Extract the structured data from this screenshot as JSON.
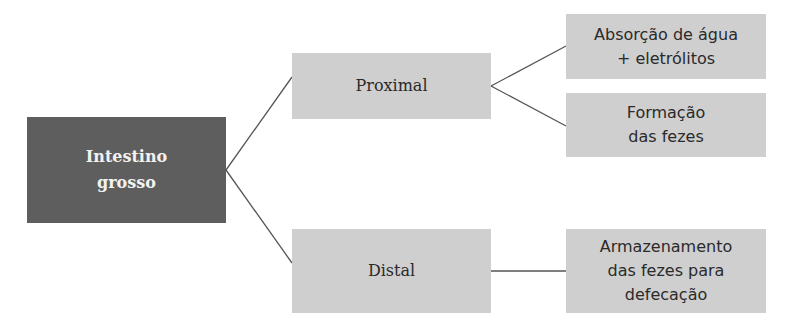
{
  "diagram": {
    "root": {
      "label": "Intestino\ngrosso"
    },
    "branches": [
      {
        "label": "Proximal",
        "children": [
          {
            "label": "Absorção de água\n+ eletrólitos"
          },
          {
            "label": "Formação\ndas fezes"
          }
        ]
      },
      {
        "label": "Distal",
        "children": [
          {
            "label": "Armazenamento\ndas fezes para\ndefecação"
          }
        ]
      }
    ]
  },
  "colors": {
    "root_fill": "#5e5e5e",
    "node_fill": "#cfcfcf",
    "connector": "#555555"
  }
}
